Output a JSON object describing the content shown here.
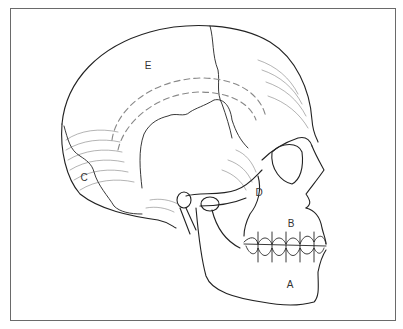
{
  "figure": {
    "style": "pen-and-ink line drawing",
    "border_color": "#6a6a6a",
    "line_color": "#222222",
    "labels": [
      {
        "id": "A",
        "text": "A",
        "x": 290,
        "y": 285
      },
      {
        "id": "B",
        "text": "B",
        "x": 291,
        "y": 224
      },
      {
        "id": "C",
        "text": "C",
        "x": 84,
        "y": 178
      },
      {
        "id": "D",
        "text": "D",
        "x": 259,
        "y": 193
      },
      {
        "id": "E",
        "text": "E",
        "x": 148,
        "y": 66
      }
    ]
  }
}
